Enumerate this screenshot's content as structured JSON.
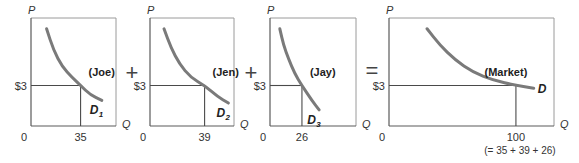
{
  "chart_data": [
    {
      "type": "line",
      "title": "Joe",
      "curve_label": "(Joe)",
      "demand_label": "D",
      "demand_subscript": "1",
      "xlabel": "Q",
      "ylabel": "P",
      "origin_label": "0",
      "price_label": "$3",
      "price": 3,
      "quantity": 35,
      "quantity_label": "35",
      "xlim": [
        0,
        60
      ],
      "ylim": [
        0,
        8
      ],
      "curve": [
        [
          11,
          7.2
        ],
        [
          16,
          5.6
        ],
        [
          22,
          4.4
        ],
        [
          29,
          3.6
        ],
        [
          35,
          3
        ],
        [
          42,
          2.3
        ],
        [
          50,
          1.9
        ]
      ]
    },
    {
      "type": "line",
      "title": "Jen",
      "curve_label": "(Jen)",
      "demand_label": "D",
      "demand_subscript": "2",
      "xlabel": "Q",
      "ylabel": "P",
      "origin_label": "0",
      "price_label": "$3",
      "price": 3,
      "quantity": 39,
      "quantity_label": "39",
      "xlim": [
        0,
        60
      ],
      "ylim": [
        0,
        8
      ],
      "curve": [
        [
          10,
          7.2
        ],
        [
          15,
          5.8
        ],
        [
          21,
          4.6
        ],
        [
          29,
          3.6
        ],
        [
          39,
          3
        ],
        [
          48,
          2.2
        ],
        [
          56,
          1.7
        ]
      ]
    },
    {
      "type": "line",
      "title": "Jay",
      "curve_label": "(Jay)",
      "demand_label": "D",
      "demand_subscript": "3",
      "xlabel": "Q",
      "ylabel": "P",
      "origin_label": "0",
      "price_label": "$3",
      "price": 3,
      "quantity": 26,
      "quantity_label": "26",
      "xlim": [
        0,
        70
      ],
      "ylim": [
        0,
        8
      ],
      "curve": [
        [
          8,
          7.2
        ],
        [
          11,
          6.0
        ],
        [
          15,
          5.0
        ],
        [
          20,
          3.9
        ],
        [
          26,
          3
        ],
        [
          34,
          1.9
        ],
        [
          40,
          1.2
        ]
      ]
    },
    {
      "type": "line",
      "title": "Market",
      "curve_label": "(Market)",
      "demand_label": "D",
      "demand_subscript": "",
      "xlabel": "Q",
      "ylabel": "P",
      "origin_label": "0",
      "price_label": "$3",
      "price": 3,
      "quantity": 100,
      "quantity_label": "100",
      "quantity_note": "(= 35 + 39 + 26)",
      "xlim": [
        0,
        130
      ],
      "ylim": [
        0,
        8
      ],
      "curve": [
        [
          30,
          7.2
        ],
        [
          40,
          6.0
        ],
        [
          52,
          4.9
        ],
        [
          66,
          4.0
        ],
        [
          82,
          3.4
        ],
        [
          100,
          3
        ],
        [
          114,
          2.8
        ]
      ]
    }
  ],
  "operators": [
    "+",
    "+",
    "="
  ]
}
